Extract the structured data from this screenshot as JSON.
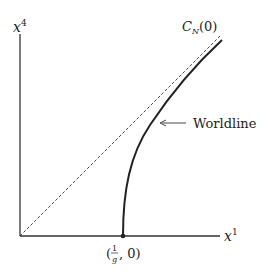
{
  "axes": {
    "x_label": "x",
    "x_sup": "1",
    "y_label": "x",
    "y_sup": "4"
  },
  "light_cone": {
    "label_main": "C",
    "label_sub": "N",
    "label_arg": "(0)",
    "style": "dashed"
  },
  "worldline": {
    "label": "Worldline",
    "start_point": {
      "label_open": "(",
      "numerator": "1",
      "denominator": "g",
      "label_rest": ", 0)"
    }
  },
  "colors": {
    "ink": "#222222",
    "background": "#ffffff"
  }
}
